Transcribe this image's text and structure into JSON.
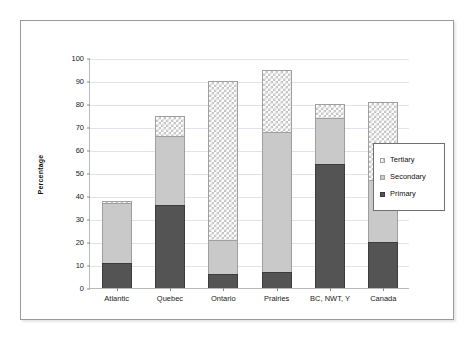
{
  "chart_data": {
    "type": "bar",
    "stacked": true,
    "title": "",
    "subtitle": "",
    "xlabel": "",
    "ylabel": "Percentage",
    "ylim": [
      0,
      100
    ],
    "ytick_step": 10,
    "yticks": [
      0,
      10,
      20,
      30,
      40,
      50,
      60,
      70,
      80,
      90,
      100
    ],
    "grid": true,
    "grid_axis": "y",
    "legend_position": "right",
    "categories": [
      "Atlantic",
      "Quebec",
      "Ontario",
      "Prairies",
      "BC, NWT, Y",
      "Canada"
    ],
    "series": [
      {
        "name": "Primary",
        "values": [
          11,
          36,
          6,
          7,
          54,
          20
        ],
        "color": "#545454",
        "pattern": "solid-dark"
      },
      {
        "name": "Secondary",
        "values": [
          26,
          30,
          15,
          61,
          20,
          27
        ],
        "color": "#c9c9c9",
        "pattern": "solid-light"
      },
      {
        "name": "Tertiary",
        "values": [
          1,
          9,
          69,
          27,
          6,
          34
        ],
        "color": "#ffffff",
        "pattern": "checkered"
      }
    ],
    "stack_totals": [
      38,
      75,
      90,
      95,
      80,
      81
    ],
    "legend_order": [
      "Tertiary",
      "Secondary",
      "Primary"
    ]
  },
  "legend": {
    "items": [
      {
        "label": "Tertiary"
      },
      {
        "label": "Secondary"
      },
      {
        "label": "Primary"
      }
    ]
  },
  "axis": {
    "y_title": "Percentage"
  }
}
